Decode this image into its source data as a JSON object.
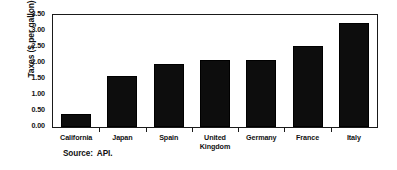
{
  "chart_data": {
    "type": "bar",
    "title": "",
    "subtitle": "",
    "xlabel": "",
    "ylabel": "Taxes ($ per gallon)",
    "categories": [
      "California",
      "Japan",
      "Spain",
      "United Kingdom",
      "Germany",
      "France",
      "Italy"
    ],
    "category_lines": [
      [
        "California"
      ],
      [
        "Japan"
      ],
      [
        "Spain"
      ],
      [
        "United",
        "Kingdom"
      ],
      [
        "Germany"
      ],
      [
        "France"
      ],
      [
        "Italy"
      ]
    ],
    "values": [
      0.42,
      1.6,
      1.97,
      2.08,
      2.1,
      2.52,
      3.25
    ],
    "ylim": [
      0.0,
      3.5
    ],
    "ytick_values": [
      0.0,
      0.5,
      1.0,
      1.5,
      2.0,
      2.5,
      3.0,
      3.5
    ],
    "ytick_labels": [
      "0.00",
      "0.50",
      "1.00",
      "1.50",
      "2.00",
      "2.50",
      "3.00",
      "3.50"
    ],
    "grid": false,
    "legend": false,
    "legend_position": "none",
    "bar_color": "#0d0d0d",
    "axis_color": "#1a1a1a",
    "background_color": "#ffffff"
  },
  "annotations": {
    "source": "Source:  API."
  }
}
